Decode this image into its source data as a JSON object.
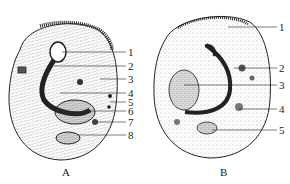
{
  "figure": {
    "panels": [
      {
        "id": "A",
        "caption": "A",
        "labels": [
          "1",
          "2",
          "3",
          "4",
          "5",
          "6",
          "7",
          "8"
        ]
      },
      {
        "id": "B",
        "caption": "B",
        "labels": [
          "1",
          "2",
          "3",
          "4",
          "5"
        ]
      }
    ]
  },
  "colors": {
    "ink": "#1a1a1a",
    "stipple": "#555555",
    "background": "#ffffff"
  }
}
